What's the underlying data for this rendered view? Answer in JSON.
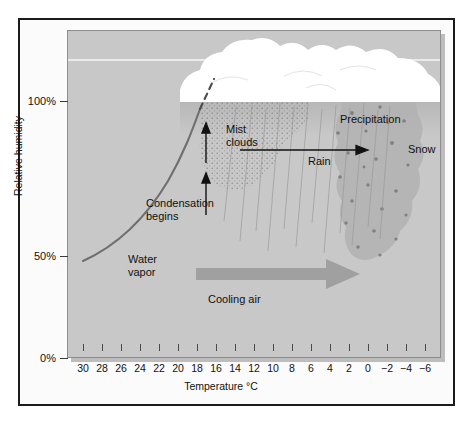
{
  "figure": {
    "background_color": "#ffffff",
    "frame_color": "#1b1b1b",
    "panel_color": "#c8c8c8"
  },
  "axes": {
    "y_axis_title": "Relative humidity",
    "y_tick_labels": [
      "100%",
      "50%",
      "0%"
    ],
    "y_tick_values": [
      100,
      50,
      0
    ],
    "x_axis_title": "Temperature °C",
    "x_tick_labels": [
      "30",
      "28",
      "26",
      "24",
      "22",
      "20",
      "18",
      "16",
      "14",
      "12",
      "10",
      "8",
      "6",
      "4",
      "2",
      "0",
      "−2",
      "−4",
      "−6"
    ]
  },
  "annotations": {
    "water_vapor": "Water\nvapor",
    "water_vapor_line1": "Water",
    "water_vapor_line2": "vapor",
    "condensation_line1": "Condensation",
    "condensation_line2": "begins",
    "mist_line1": "Mist",
    "mist_line2": "clouds",
    "rain": "Rain",
    "precipitation": "Precipitation",
    "snow": "Snow",
    "cooling_air": "Cooling air"
  },
  "chart_data": {
    "type": "line",
    "title": "",
    "xlabel": "Temperature °C",
    "ylabel": "Relative humidity",
    "xlim": [
      31,
      -7
    ],
    "ylim": [
      0,
      120
    ],
    "x_reversed": true,
    "grid": false,
    "legend": null,
    "categories": [
      "30",
      "28",
      "26",
      "24",
      "22",
      "20",
      "18",
      "16",
      "14",
      "12",
      "10",
      "8",
      "6",
      "4",
      "2",
      "0",
      "-2",
      "-4",
      "-6"
    ],
    "series": [
      {
        "name": "Relative humidity of cooling air parcel",
        "x": [
          30,
          28,
          26,
          24,
          22,
          20,
          18.5
        ],
        "values": [
          40,
          46,
          54,
          63,
          76,
          92,
          100
        ],
        "color": "#6f6f6f",
        "style": "solid"
      },
      {
        "name": "Saturated (condensation) continuation",
        "x": [
          18.5,
          17.5
        ],
        "values": [
          100,
          108
        ],
        "color": "#4a4a4a",
        "style": "dashed"
      }
    ],
    "annotations": [
      {
        "text": "Water vapor",
        "x": 23,
        "y": 45
      },
      {
        "text": "Condensation begins",
        "x": 19,
        "y": 70
      },
      {
        "text": "Mist clouds",
        "x": 16,
        "y": 88
      },
      {
        "text": "Rain",
        "x": 10,
        "y": 85
      },
      {
        "text": "Precipitation",
        "x": 7,
        "y": 95
      },
      {
        "text": "Snow",
        "x": 0,
        "y": 86
      },
      {
        "text": "Cooling air",
        "x": 13,
        "y": 30
      }
    ]
  }
}
